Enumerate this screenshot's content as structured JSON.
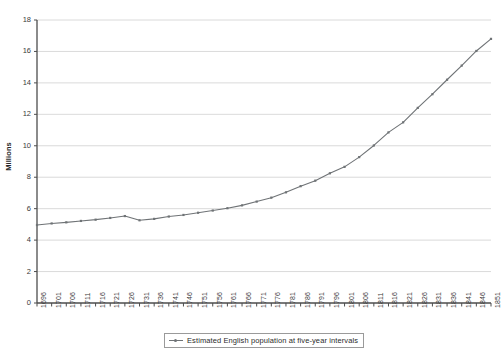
{
  "chart_data": {
    "type": "line",
    "title": "",
    "xlabel": "",
    "ylabel": "Millions",
    "ylim": [
      0,
      18
    ],
    "ytick_step": 2,
    "yticks": [
      0,
      2,
      4,
      6,
      8,
      10,
      12,
      14,
      16,
      18
    ],
    "grid": "horizontal",
    "legend_position": "bottom-center",
    "legend": [
      "Estimated English population at five-year intervals"
    ],
    "series_color": "#6f7376",
    "axis_color": "#4d4d4d",
    "grid_color": "#d0d0d0",
    "categories": [
      "1696",
      "1701",
      "1706",
      "1711",
      "1716",
      "1721",
      "1726",
      "1731",
      "1736",
      "1741",
      "1746",
      "1751",
      "1756",
      "1761",
      "1766",
      "1771",
      "1776",
      "1781",
      "1786",
      "1791",
      "1796",
      "1801",
      "1806",
      "1811",
      "1816",
      "1821",
      "1826",
      "1831",
      "1836",
      "1841",
      "1846",
      "1851"
    ],
    "series": [
      {
        "name": "Estimated English population at five-year intervals",
        "values": [
          4.96,
          5.06,
          5.13,
          5.22,
          5.3,
          5.41,
          5.53,
          5.26,
          5.35,
          5.5,
          5.6,
          5.74,
          5.88,
          6.03,
          6.21,
          6.45,
          6.7,
          7.04,
          7.43,
          7.78,
          8.25,
          8.66,
          9.28,
          10.02,
          10.85,
          11.49,
          12.41,
          13.28,
          14.2,
          15.1,
          16.03,
          16.8
        ]
      }
    ]
  }
}
